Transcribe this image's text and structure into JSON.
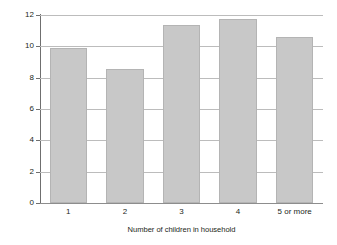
{
  "chart_data": {
    "type": "bar",
    "title": "",
    "subtitle": "",
    "xlabel": "Number of children in household",
    "ylabel": "Percentage of children with a mental disorder",
    "categories": [
      "1",
      "2",
      "3",
      "4",
      "5 or more"
    ],
    "values": [
      9.9,
      8.55,
      11.35,
      11.75,
      10.6
    ],
    "series": [
      {
        "name": "Percentage of children with a mental disorder",
        "values": [
          9.9,
          8.55,
          11.35,
          11.75,
          10.6
        ]
      }
    ],
    "ylim": [
      0,
      12
    ],
    "xlim": [
      0,
      5
    ],
    "ytick_labels": [
      "0",
      "2",
      "4",
      "6",
      "8",
      "10",
      "12"
    ],
    "ytick_values": [
      0,
      2,
      4,
      6,
      8,
      10,
      12
    ],
    "grid": "horizontal",
    "legend": "none",
    "annotations": [],
    "colors": {
      "bar_fill": "#c8c8c8",
      "bar_edge": "#b4b4b4",
      "gridline": "#bcbcbc",
      "axis_line": "#6f6f6f",
      "text": "#231f20",
      "background": "#ffffff"
    }
  }
}
